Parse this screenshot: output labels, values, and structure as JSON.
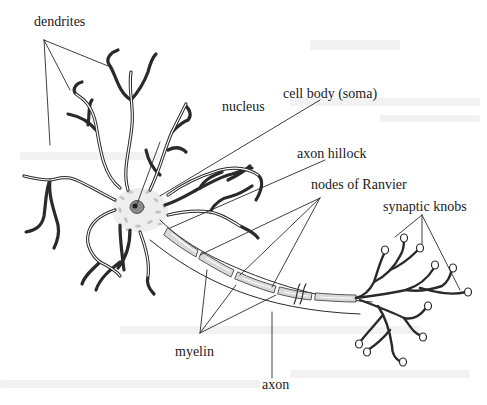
{
  "diagram": {
    "labels": {
      "dendrites": "dendrites",
      "nucleus": "nucleus",
      "cell_body": "cell body (soma)",
      "axon_hillock": "axon hillock",
      "nodes_of_ranvier": "nodes of Ranvier",
      "synaptic_knobs": "synaptic knobs",
      "myelin": "myelin",
      "axon": "axon"
    },
    "colors": {
      "line": "#2a2a2a",
      "myelin_fill": "#d8d8d8",
      "soma_speckle": "#c4c4c4",
      "nucleus_fill": "#8a8a8a",
      "nucleolus_fill": "#1f1f1f",
      "background": "#ffffff"
    }
  }
}
